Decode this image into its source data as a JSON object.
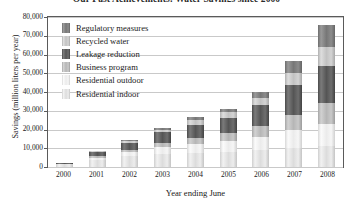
{
  "chart_data": {
    "type": "bar",
    "subtype": "stacked-column",
    "title": "Our Past Achievements: Water Savings since 2000",
    "title_clipped": true,
    "xlabel": "Year ending June",
    "ylabel": "Savings (million liters per year)",
    "categories": [
      "2000",
      "2001",
      "2002",
      "2003",
      "2004",
      "2005",
      "2006",
      "2007",
      "2008"
    ],
    "ylim": [
      0,
      80000
    ],
    "ytick_labels": [
      "80,000",
      "70,000",
      "60,000",
      "50,000",
      "40,000",
      "30,000",
      "20,000",
      "10,000",
      "0"
    ],
    "ytick_values": [
      80000,
      70000,
      60000,
      50000,
      40000,
      30000,
      20000,
      10000,
      0
    ],
    "ytick_step": 10000,
    "grid": true,
    "grid_axis": "y",
    "legend_position": "upper-left-inside",
    "series": [
      {
        "name": "Residential indoor",
        "color": "#dcdcdc",
        "values": [
          1500,
          4000,
          5800,
          7000,
          7600,
          8200,
          9000,
          10000,
          11000
        ]
      },
      {
        "name": "Residential outdoor",
        "color": "#ededed",
        "values": [
          0,
          1000,
          2000,
          3500,
          4500,
          5500,
          7000,
          9500,
          12000
        ]
      },
      {
        "name": "Business program",
        "color": "#b6b6b6",
        "values": [
          0,
          800,
          1500,
          2500,
          3500,
          4500,
          6000,
          8500,
          11000
        ]
      },
      {
        "name": "Leakage reduction",
        "color": "#555555",
        "values": [
          500,
          2000,
          3500,
          5500,
          7000,
          8000,
          11000,
          16000,
          20000
        ]
      },
      {
        "name": "Recycled water",
        "color": "#c2c2c2",
        "values": [
          0,
          500,
          900,
          1500,
          2400,
          3000,
          4000,
          6000,
          10000
        ]
      },
      {
        "name": "Regulatory measures",
        "color": "#777777",
        "values": [
          0,
          400,
          800,
          1000,
          1500,
          2000,
          3000,
          6500,
          12000
        ]
      }
    ],
    "totals": [
      2000,
      8700,
      14500,
      21000,
      26500,
      31200,
      40000,
      56500,
      76000
    ],
    "legend_order_top_to_bottom": [
      "Regulatory measures",
      "Recycled water",
      "Leakage reduction",
      "Business program",
      "Residential outdoor",
      "Residential indoor"
    ]
  },
  "legend": {
    "items": [
      {
        "label": "Regulatory measures",
        "swatch_class": "s-regulatory"
      },
      {
        "label": "Recycled water",
        "swatch_class": "s-recycled"
      },
      {
        "label": "Leakage reduction",
        "swatch_class": "s-leakage"
      },
      {
        "label": "Business program",
        "swatch_class": "s-business"
      },
      {
        "label": "Residential outdoor",
        "swatch_class": "s-resoutdoor"
      },
      {
        "label": "Residential indoor",
        "swatch_class": "s-resindoor"
      }
    ]
  }
}
